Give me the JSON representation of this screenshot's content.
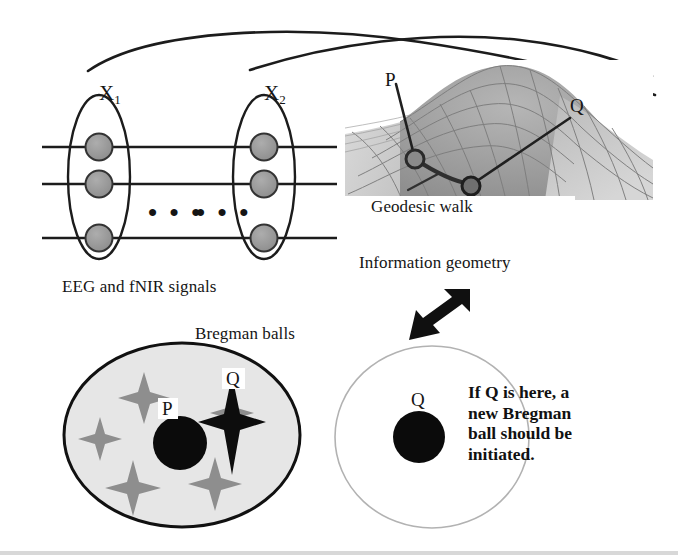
{
  "figure": {
    "background_color": "#ffffff",
    "width": 678,
    "height": 555
  },
  "signals_panel": {
    "group_labels": [
      {
        "name": "X",
        "subscript": "1"
      },
      {
        "name": "X",
        "subscript": "2"
      }
    ],
    "caption": "EEG and fNIR signals",
    "ellipsis_left": "• • •",
    "ellipsis_right": "• • •",
    "node_count_per_group": 3,
    "channel_line_count": 3,
    "node_fill_color": "#9a9a9a",
    "node_stroke_color": "#2b2b2b"
  },
  "manifold_panel": {
    "caption": "Geodesic walk",
    "point_labels": [
      "P",
      "Q"
    ],
    "surface_fill_light": "#cfcfcf",
    "surface_fill_dark": "#9d9d9d",
    "geodesic_color": "#3a3a3a"
  },
  "transition": {
    "label": "Information geometry",
    "arrow_icon": "down-left-arrow-icon",
    "arrow_color": "#111111"
  },
  "bregman_panel": {
    "title": "Bregman balls",
    "existing_ball": {
      "center_label": "P",
      "outlier_label": "Q",
      "fill_color": "#e4e4e4",
      "stroke_color": "#111111",
      "gray_star_count": 5,
      "black_star_count": 1,
      "star_gray_color": "#8e8e8e",
      "star_black_color": "#0d0d0d"
    },
    "new_ball": {
      "center_label": "Q",
      "fill_color": "#ffffff",
      "stroke_color": "#b0b0b0",
      "note_lines": [
        "If Q is here, a",
        "new Bregman",
        "ball should be",
        "initiated."
      ]
    }
  }
}
